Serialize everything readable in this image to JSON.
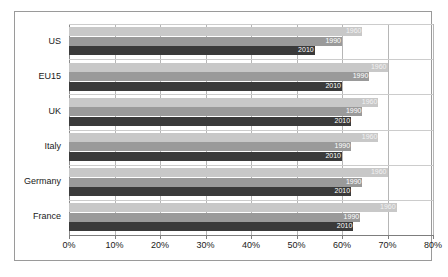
{
  "chart_data": {
    "type": "bar",
    "orientation": "horizontal",
    "title": "",
    "xlabel": "",
    "ylabel": "",
    "xlim": [
      0,
      80
    ],
    "xtick_labels": [
      "0%",
      "10%",
      "20%",
      "30%",
      "40%",
      "50%",
      "60%",
      "70%",
      "80%"
    ],
    "xtick_values": [
      0,
      10,
      20,
      30,
      40,
      50,
      60,
      70,
      80
    ],
    "grid": true,
    "legend": "none",
    "data_labels": true,
    "categories": [
      "US",
      "EU15",
      "UK",
      "Italy",
      "Germany",
      "France"
    ],
    "series": [
      {
        "name": "1960",
        "color": "#c8c8c8",
        "values": [
          64.5,
          70.0,
          68.0,
          68.0,
          70.0,
          72.0
        ]
      },
      {
        "name": "1990",
        "color": "#9a9a9a",
        "values": [
          60.0,
          66.0,
          64.5,
          62.0,
          64.5,
          64.0
        ]
      },
      {
        "name": "2010",
        "color": "#3a3a3a",
        "values": [
          54.0,
          60.0,
          62.0,
          60.0,
          62.0,
          62.5
        ]
      }
    ]
  },
  "colors": {
    "frame_border": "#9a9a9a",
    "gridline": "#b6b6b6",
    "axis_line": "#7d7d7d",
    "background": "#ffffff",
    "label_text": "#1a1a1a"
  }
}
